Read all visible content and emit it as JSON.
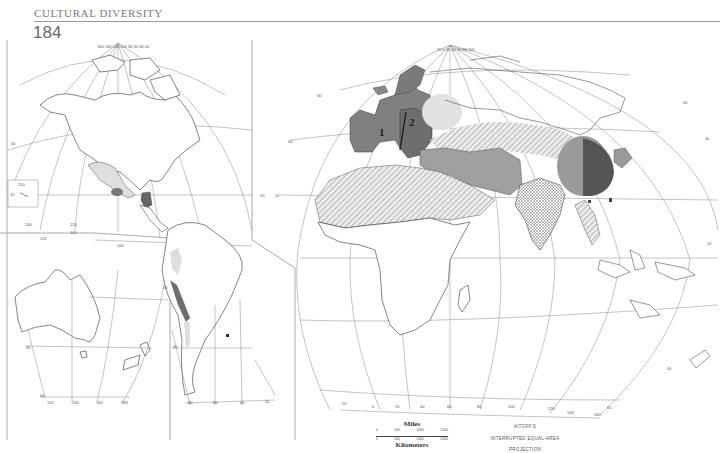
{
  "header": {
    "section_title": "CULTURAL DIVERSITY",
    "page_number": "184"
  },
  "map": {
    "projection_line1": "AITOFF'S",
    "projection_line2": "INTERRUPTED EQUAL-AREA",
    "projection_line3": "PROJECTION",
    "region_labels": {
      "europe_1": "1",
      "europe_2": "2"
    },
    "shading": {
      "dark": "#6e6e6e",
      "medium": "#9b9b9b",
      "light": "#c8c8c8",
      "stippled": "#dadada",
      "hatched": "#bdbdbd"
    },
    "scale": {
      "miles_label": "Miles",
      "miles_ticks": [
        "0",
        "500",
        "1000",
        "1500"
      ],
      "km_label": "Kilometers",
      "km_ticks": [
        "0",
        "500",
        "1000",
        "2000"
      ]
    },
    "graticule_labels": {
      "americas_top": [
        "160",
        "140",
        "120",
        "100",
        "80",
        "60",
        "40",
        "20"
      ],
      "americas_lat": [
        "60",
        "40",
        "20",
        "0"
      ],
      "oceania_bottom": [
        "120",
        "140",
        "160",
        "180"
      ],
      "oceania_lat": [
        "40",
        "60",
        "20",
        "0"
      ],
      "oceania_inset": [
        "160",
        "150",
        "20"
      ],
      "south_america_bottom": [
        "80",
        "60",
        "40",
        "20"
      ],
      "south_america_lat": [
        "40",
        "60",
        "20"
      ],
      "eurasia_bottom": [
        "20",
        "0",
        "20",
        "40",
        "60",
        "80",
        "100",
        "120",
        "140",
        "160"
      ],
      "eurasia_lat": [
        "60",
        "40",
        "20",
        "0",
        "20",
        "40",
        "60"
      ]
    }
  }
}
